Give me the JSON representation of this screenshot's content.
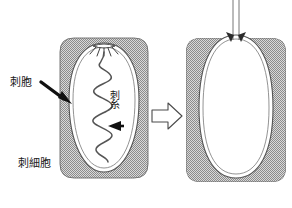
{
  "figure": {
    "title": "",
    "type": "biological-diagram",
    "background_color": "#ffffff",
    "ink_color": "#1a1a1a",
    "cell_fill_color": "#b3b3b3",
    "capsule_fill_color": "#ffffff",
    "outline_color": "#4d4d4d"
  },
  "labels": {
    "cnidocyte_capsule": "刺胞",
    "stinging_cell": "刺細胞",
    "thread": "刺糸"
  },
  "panels": {
    "left": {
      "name": "undischarged",
      "state_description": "coiled thread inside capsule"
    },
    "right": {
      "name": "discharged",
      "state_description": "thread everted and projecting outward"
    }
  },
  "arrows": {
    "transition": "right-arrow",
    "pointer_capsule": "black-arrow",
    "pointer_thread": "black-arrow",
    "discharge_barbs": "double-arrowhead"
  }
}
